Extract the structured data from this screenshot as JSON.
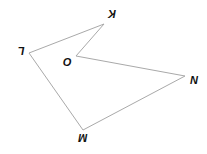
{
  "diagram": {
    "type": "polygon",
    "shape": "pentagon KLMNO",
    "stroke_color": "#a9a9a9",
    "label_color": "#111111",
    "vertices": [
      {
        "name": "K",
        "x": 104,
        "y": 24,
        "label": "K",
        "label_x": 112,
        "label_y": 13,
        "rotation": 180
      },
      {
        "name": "L",
        "x": 29,
        "y": 53,
        "label": "L",
        "label_x": 21,
        "label_y": 50,
        "rotation": 180
      },
      {
        "name": "M",
        "x": 83,
        "y": 130,
        "label": "M",
        "label_x": 83,
        "label_y": 137,
        "rotation": 180
      },
      {
        "name": "N",
        "x": 185,
        "y": 76,
        "label": "N",
        "label_x": 194,
        "label_y": 81,
        "rotation": 0
      },
      {
        "name": "O",
        "x": 76,
        "y": 56,
        "label": "O",
        "label_x": 67,
        "label_y": 63,
        "rotation": 0
      }
    ]
  }
}
